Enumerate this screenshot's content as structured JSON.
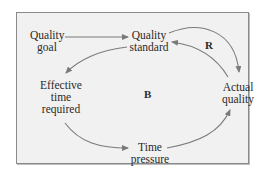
{
  "diagram": {
    "type": "causal-loop",
    "nodes": {
      "quality_goal": {
        "line1": "Quality",
        "line2": "goal"
      },
      "quality_standard": {
        "line1": "Quality",
        "line2": "standard"
      },
      "actual_quality": {
        "line1": "Actual",
        "line2": "quality"
      },
      "effective_time": {
        "line1": "Effective",
        "line2": "time",
        "line3": "required"
      },
      "time_pressure": {
        "line1": "Time",
        "line2": "pressure"
      }
    },
    "loops": {
      "reinforcing": "R",
      "balancing": "B"
    },
    "edges": [
      {
        "from": "Quality goal",
        "to": "Quality standard"
      },
      {
        "from": "Quality standard",
        "to": "Actual quality"
      },
      {
        "from": "Actual quality",
        "to": "Quality standard"
      },
      {
        "from": "Quality standard",
        "to": "Effective time required"
      },
      {
        "from": "Effective time required",
        "to": "Time pressure"
      },
      {
        "from": "Time pressure",
        "to": "Actual quality"
      }
    ],
    "colors": {
      "background": "#f1f1f1",
      "arrow": "#7a7a7a",
      "text": "#2a2a2a"
    }
  }
}
